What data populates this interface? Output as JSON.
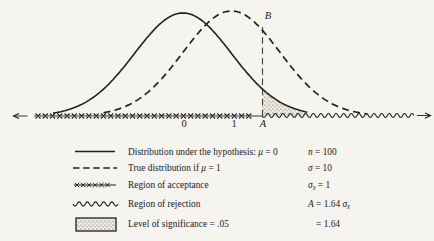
{
  "figure": {
    "background": "#f6f4ef",
    "ink": "#23211d",
    "axis_labels": {
      "zero": "0",
      "one": "1",
      "a": "A",
      "b": "B"
    },
    "legend": {
      "rows": [
        {
          "sample": "solid-line",
          "label": [
            {
              "t": "Distribution under the hypothesis: "
            },
            {
              "t": "μ",
              "s": "it"
            },
            {
              "t": " = 0"
            }
          ],
          "value": [
            {
              "t": "n",
              "s": "it"
            },
            {
              "t": " = 100"
            }
          ]
        },
        {
          "sample": "dashed-line",
          "label": [
            {
              "t": "True distribution if "
            },
            {
              "t": "μ",
              "s": "it"
            },
            {
              "t": " = 1"
            }
          ],
          "value": [
            {
              "t": "σ",
              "s": "it"
            },
            {
              "t": " = 10"
            }
          ]
        },
        {
          "sample": "x-marks-line",
          "label": [
            {
              "t": "Region of acceptance"
            }
          ],
          "value": [
            {
              "t": "σ",
              "s": "it"
            },
            {
              "t": "x̄",
              "s": "sub"
            },
            {
              "t": " = 1"
            }
          ]
        },
        {
          "sample": "wavy-line",
          "label": [
            {
              "t": "Region of rejection"
            }
          ],
          "value": [
            {
              "t": "A",
              "s": "it"
            },
            {
              "t": " = 1.64 "
            },
            {
              "t": "σ",
              "s": "it"
            },
            {
              "t": "x̄",
              "s": "sub"
            }
          ]
        },
        {
          "sample": "stipple-box",
          "label": [
            {
              "t": "Level of significance = .05"
            }
          ],
          "value": [
            {
              "t": "= 1.64"
            }
          ]
        }
      ]
    }
  },
  "chart_data": {
    "type": "area",
    "title": "",
    "xlabel": "",
    "ylabel": "",
    "x_unit": "standard errors of the mean (σx̄)",
    "series": [
      {
        "name": "Distribution under the hypothesis: μ = 0",
        "shape": "normal",
        "mu": 0,
        "sigma": 1,
        "style": "solid"
      },
      {
        "name": "True distribution if μ = 1",
        "shape": "normal",
        "mu": 1,
        "sigma": 1,
        "style": "dashed"
      }
    ],
    "x_ticks": [
      {
        "u": 0,
        "label": "0"
      },
      {
        "u": 1,
        "label": "1"
      },
      {
        "u": 1.64,
        "label": "A"
      }
    ],
    "critical_value": {
      "label": "A",
      "u": 1.64
    },
    "point_b": {
      "label": "B",
      "at": "true distribution curve above A"
    },
    "regions": [
      {
        "name": "Region of acceptance",
        "range_u": [
          -3.1,
          1.64
        ]
      },
      {
        "name": "Region of rejection",
        "range_u": [
          1.64,
          4.6
        ]
      }
    ],
    "shaded_area": {
      "name": "Level of significance",
      "alpha": 0.05,
      "under": "hypothesis distribution",
      "range_u": [
        1.64,
        2.56
      ]
    },
    "params": {
      "n": 100,
      "sigma": 10,
      "sigma_xbar": 1,
      "A": "1.64 σx̄",
      "A_value": 1.64
    },
    "layout": {
      "baseline_px": 116,
      "mu0_px": 183,
      "unit_px": 48.5,
      "amp_px": 103,
      "amp2_px": 105,
      "solid_range_u": [
        -2.68,
        2.56
      ],
      "dashed_range_u": [
        -2.64,
        2.8
      ],
      "vline_top_px": 27,
      "axis": {
        "left_arrow": [
          13.5,
          27.5
        ],
        "line": [
          34,
          263
        ],
        "xmarks": [
          38,
          256,
          7.27
        ],
        "wavy": [
          262,
          414
        ],
        "right_arrow": [
          417,
          430.5
        ]
      },
      "legend_samples": {
        "x": [
          74,
          117
        ],
        "rows_y": [
          151.5,
          168,
          185,
          204
        ],
        "box": [
          76,
          218,
          40,
          13
        ]
      }
    }
  }
}
